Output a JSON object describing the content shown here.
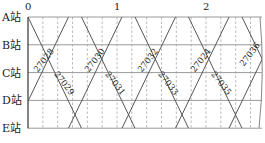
{
  "diagram": {
    "type": "train-operation-diagram",
    "time_axis": {
      "ticks": [
        "0",
        "1",
        "2"
      ],
      "unit_hours": 1,
      "minor_interval_minutes": 10
    },
    "stations": [
      "A站",
      "B站",
      "C站",
      "D站",
      "E站"
    ],
    "up_trains": [
      "27028",
      "27030",
      "27032",
      "27024",
      "27036"
    ],
    "down_trains": [
      "27029",
      "27031",
      "27033",
      "27035"
    ],
    "colors": {
      "grid": "#9a9a9a",
      "line": "#555555",
      "dashed": "#aaaaaa"
    }
  }
}
